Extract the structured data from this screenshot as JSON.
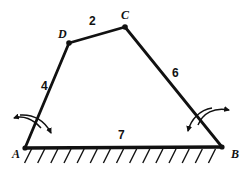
{
  "figure": {
    "background_color": "#ffffff",
    "stroke_color": "#111111",
    "vertices": [
      {
        "name": "A",
        "label": "A",
        "x": 25,
        "y": 148,
        "label_x": 12,
        "label_y": 158,
        "dot": true
      },
      {
        "name": "B",
        "label": "B",
        "x": 222,
        "y": 147,
        "label_x": 231,
        "label_y": 158,
        "dot": true
      },
      {
        "name": "C",
        "label": "C",
        "x": 125,
        "y": 27,
        "label_x": 121,
        "label_y": 19,
        "dot": true
      },
      {
        "name": "D",
        "label": "D",
        "x": 69,
        "y": 43,
        "label_x": 58,
        "label_y": 38,
        "dot": true
      }
    ],
    "edges": [
      {
        "name": "edge-AD",
        "from": "A",
        "to": "D",
        "length_label": "4",
        "label_x": 41,
        "label_y": 90
      },
      {
        "name": "edge-DC",
        "from": "D",
        "to": "C",
        "length_label": "2",
        "label_x": 89,
        "label_y": 25
      },
      {
        "name": "edge-CB",
        "from": "C",
        "to": "B",
        "length_label": "6",
        "label_x": 172,
        "label_y": 77
      },
      {
        "name": "edge-AB",
        "from": "A",
        "to": "B",
        "length_label": "7",
        "label_x": 118,
        "label_y": 139
      }
    ],
    "ground": {
      "label": "hatched-ground-line",
      "x1": 25,
      "x2": 222,
      "y": 148,
      "hatch_count": 15,
      "hatch_length": 15,
      "hatch_slant_dx": 7
    },
    "angle_arrows": [
      {
        "name": "angle-arrow-A",
        "at_vertex": "A",
        "style": "double-headed-arc"
      },
      {
        "name": "angle-arrow-B",
        "at_vertex": "B",
        "style": "double-headed-arc"
      }
    ]
  }
}
